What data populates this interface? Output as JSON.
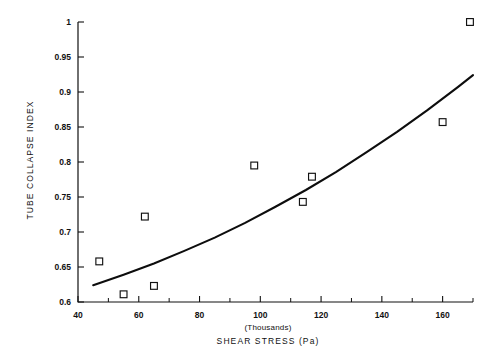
{
  "chart_data": {
    "type": "scatter",
    "title": "",
    "xlabel": "SHEAR STRESS (Pa)",
    "xlabel_note": "(Thousands)",
    "ylabel": "TUBE COLLAPSE INDEX",
    "xlim": [
      40,
      170
    ],
    "ylim": [
      0.6,
      1.0
    ],
    "grid": false,
    "legend": "none",
    "x_ticks": [
      40,
      60,
      80,
      100,
      120,
      140,
      160
    ],
    "x_tick_labels": [
      "40",
      "60",
      "80",
      "100",
      "120",
      "140",
      "160"
    ],
    "x_minor_ticks": [
      50,
      70,
      90,
      110,
      130,
      150,
      170
    ],
    "y_ticks": [
      0.6,
      0.65,
      0.7,
      0.75,
      0.8,
      0.85,
      0.9,
      0.95,
      1.0
    ],
    "y_tick_labels": [
      "0.6",
      "0.65",
      "0.7",
      "0.75",
      "0.8",
      "0.85",
      "0.9",
      "0.95",
      "1"
    ],
    "marker": "open-square",
    "points": [
      {
        "x": 47,
        "y": 0.658
      },
      {
        "x": 55,
        "y": 0.611
      },
      {
        "x": 62,
        "y": 0.722
      },
      {
        "x": 65,
        "y": 0.623
      },
      {
        "x": 98,
        "y": 0.795
      },
      {
        "x": 114,
        "y": 0.743
      },
      {
        "x": 117,
        "y": 0.779
      },
      {
        "x": 160,
        "y": 0.857
      },
      {
        "x": 169,
        "y": 1.0
      }
    ],
    "series": [
      {
        "name": "fitted curve",
        "type": "line",
        "x": [
          45,
          55,
          65,
          75,
          85,
          95,
          105,
          115,
          125,
          135,
          145,
          155,
          165,
          170
        ],
        "y": [
          0.624,
          0.639,
          0.655,
          0.673,
          0.692,
          0.713,
          0.736,
          0.76,
          0.786,
          0.814,
          0.843,
          0.874,
          0.907,
          0.924
        ]
      }
    ],
    "colors": {
      "axis": "#111111",
      "curve": "#0d0d0d",
      "marker_edge": "#111111",
      "marker_fill": "#ffffff",
      "background": "#ffffff"
    }
  }
}
